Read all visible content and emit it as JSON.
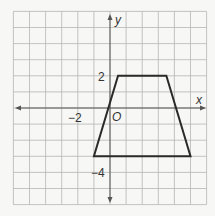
{
  "chart_data": {
    "type": "coordinate-plane",
    "grid": {
      "x_min": -6,
      "x_max": 6,
      "y_min": -6,
      "y_max": 6,
      "step": 1
    },
    "axes": {
      "x_label": "x",
      "y_label": "y",
      "origin_label": "O"
    },
    "tick_labels": [
      {
        "axis": "x",
        "value": -2,
        "text": "−2"
      },
      {
        "axis": "y",
        "value": 2,
        "text": "2"
      },
      {
        "axis": "y",
        "value": -4,
        "text": "−4"
      }
    ],
    "shape": {
      "type": "trapezoid",
      "vertices": [
        [
          0.5,
          2
        ],
        [
          3.5,
          2
        ],
        [
          5,
          -3
        ],
        [
          -1,
          -3
        ]
      ]
    }
  },
  "labels": {
    "x_axis": "x",
    "y_axis": "y",
    "origin": "O",
    "tick_x_neg2": "−2",
    "tick_y_2": "2",
    "tick_y_neg4": "−4"
  },
  "colors": {
    "grid": "#b5b5b5",
    "axis": "#555555",
    "shape": "#2a2a2a",
    "background": "#f7f7f5"
  }
}
